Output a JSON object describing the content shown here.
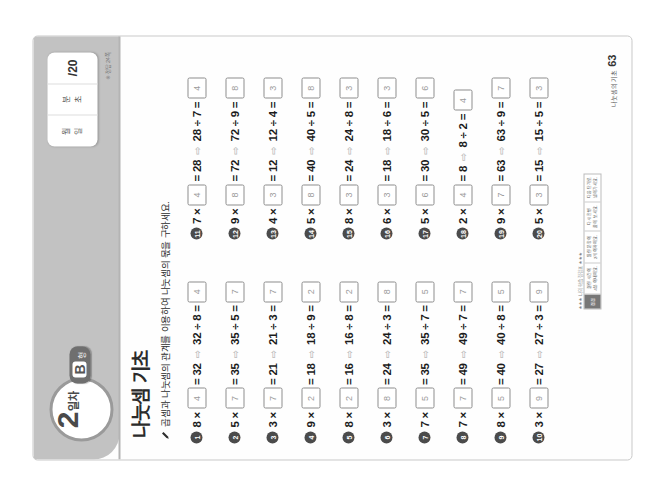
{
  "header": {
    "day_number": "2",
    "day_word": "일차",
    "type_letter": "B",
    "type_sub": "형",
    "title": "나눗셈 기초"
  },
  "score_card": {
    "date_month": "월",
    "date_day": "일",
    "time_min": "분",
    "time_sec": "초",
    "score": "/20",
    "note": "※ 정답 24쪽"
  },
  "instruction": {
    "icon": "pencil-icon",
    "text": "곱셈과 나눗셈의 관계를 이용하여 나눗셈의 몫을 구하세요."
  },
  "problems_left": [
    {
      "num": "1",
      "a": "8",
      "box1": "4",
      "product": "32",
      "dividend": "32",
      "divisor": "8",
      "box2": "4"
    },
    {
      "num": "2",
      "a": "5",
      "box1": "7",
      "product": "35",
      "dividend": "35",
      "divisor": "5",
      "box2": "7"
    },
    {
      "num": "3",
      "a": "3",
      "box1": "7",
      "product": "21",
      "dividend": "21",
      "divisor": "3",
      "box2": "7"
    },
    {
      "num": "4",
      "a": "9",
      "box1": "2",
      "product": "18",
      "dividend": "18",
      "divisor": "9",
      "box2": "2"
    },
    {
      "num": "5",
      "a": "8",
      "box1": "2",
      "product": "16",
      "dividend": "16",
      "divisor": "8",
      "box2": "2"
    },
    {
      "num": "6",
      "a": "3",
      "box1": "8",
      "product": "24",
      "dividend": "24",
      "divisor": "3",
      "box2": "8"
    },
    {
      "num": "7",
      "a": "7",
      "box1": "5",
      "product": "35",
      "dividend": "35",
      "divisor": "7",
      "box2": "5"
    },
    {
      "num": "8",
      "a": "7",
      "box1": "7",
      "product": "49",
      "dividend": "49",
      "divisor": "7",
      "box2": "7"
    },
    {
      "num": "9",
      "a": "8",
      "box1": "5",
      "product": "40",
      "dividend": "40",
      "divisor": "8",
      "box2": "5"
    },
    {
      "num": "10",
      "a": "3",
      "box1": "9",
      "product": "27",
      "dividend": "27",
      "divisor": "3",
      "box2": "9"
    }
  ],
  "problems_right": [
    {
      "num": "11",
      "a": "7",
      "box1": "4",
      "product": "28",
      "dividend": "28",
      "divisor": "7",
      "box2": "4"
    },
    {
      "num": "12",
      "a": "9",
      "box1": "8",
      "product": "72",
      "dividend": "72",
      "divisor": "9",
      "box2": "8"
    },
    {
      "num": "13",
      "a": "4",
      "box1": "3",
      "product": "12",
      "dividend": "12",
      "divisor": "4",
      "box2": "3"
    },
    {
      "num": "14",
      "a": "5",
      "box1": "8",
      "product": "40",
      "dividend": "40",
      "divisor": "5",
      "box2": "8"
    },
    {
      "num": "15",
      "a": "8",
      "box1": "3",
      "product": "24",
      "dividend": "24",
      "divisor": "8",
      "box2": "3"
    },
    {
      "num": "16",
      "a": "6",
      "box1": "3",
      "product": "18",
      "dividend": "18",
      "divisor": "6",
      "box2": "3"
    },
    {
      "num": "17",
      "a": "5",
      "box1": "6",
      "product": "30",
      "dividend": "30",
      "divisor": "5",
      "box2": "6"
    },
    {
      "num": "18",
      "a": "2",
      "box1": "4",
      "product": "8",
      "dividend": "8",
      "divisor": "2",
      "box2": "4"
    },
    {
      "num": "19",
      "a": "9",
      "box1": "7",
      "product": "63",
      "dividend": "63",
      "divisor": "9",
      "box2": "7"
    },
    {
      "num": "20",
      "a": "5",
      "box1": "3",
      "product": "15",
      "dividend": "15",
      "divisor": "5",
      "box2": "3"
    }
  ],
  "footer": {
    "page_label": "나눗셈의 기초",
    "page_number": "63",
    "table_caption": "★★★ 나의 학습 점검표 ★★★",
    "table_head": "점검",
    "table_cells": [
      "걸린 시간이\n4분 이내예요.",
      "틀린 문항이\n2개 이하예요.",
      "다시 한번\n풀어 보세요.",
      "다음 단계로\n넘어가세요."
    ]
  },
  "symbols": {
    "times": "×",
    "equals": "=",
    "divide": "÷",
    "arrow": "⇨"
  }
}
